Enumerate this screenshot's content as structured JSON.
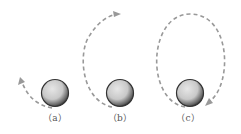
{
  "figure": {
    "panels": [
      {
        "id": "a",
        "label": "（a）",
        "description": "ball with short curved dashed trajectory rising to the left"
      },
      {
        "id": "b",
        "label": "（b）",
        "description": "ball with dashed trajectory looping up the left side to the top"
      },
      {
        "id": "c",
        "label": "（c）",
        "description": "ball with nearly complete dashed elliptical loop"
      }
    ],
    "colors": {
      "trajectory": "#999999",
      "ball_fill": "#cccccc",
      "ball_outline": "#333333",
      "label": "#555555"
    }
  }
}
